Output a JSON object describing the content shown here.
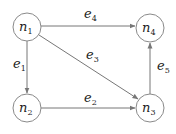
{
  "diagram": {
    "type": "directed-graph",
    "nodes": [
      {
        "id": "n1",
        "base": "n",
        "sub": "1",
        "cx": 27,
        "cy": 27
      },
      {
        "id": "n2",
        "base": "n",
        "sub": "2",
        "cx": 27,
        "cy": 108
      },
      {
        "id": "n3",
        "base": "n",
        "sub": "3",
        "cx": 150,
        "cy": 108
      },
      {
        "id": "n4",
        "base": "n",
        "sub": "4",
        "cx": 150,
        "cy": 28
      }
    ],
    "edges": [
      {
        "id": "e1",
        "base": "e",
        "sub": "1",
        "from": "n1",
        "to": "n2"
      },
      {
        "id": "e2",
        "base": "e",
        "sub": "2",
        "from": "n2",
        "to": "n3"
      },
      {
        "id": "e3",
        "base": "e",
        "sub": "3",
        "from": "n1",
        "to": "n3"
      },
      {
        "id": "e4",
        "base": "e",
        "sub": "4",
        "from": "n1",
        "to": "n4"
      },
      {
        "id": "e5",
        "base": "e",
        "sub": "5",
        "from": "n3",
        "to": "n4"
      }
    ],
    "colors": {
      "node_stroke": "#8a8a8a",
      "edge": "#777777",
      "text": "#222222"
    }
  }
}
